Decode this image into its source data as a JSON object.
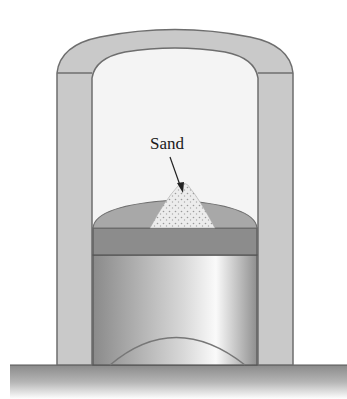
{
  "figure": {
    "type": "piston-cylinder diagram",
    "labels": {
      "sand": "Sand"
    },
    "colors": {
      "wall": "#c9c9c9",
      "wall_outline": "#6e6e6e",
      "interior": "#f3f3f3",
      "piston_dome": "#a8a8a8",
      "piston_plate": "#8c8c8c",
      "sand": "#e4e4e4",
      "ground": "#8f8f8f"
    }
  }
}
